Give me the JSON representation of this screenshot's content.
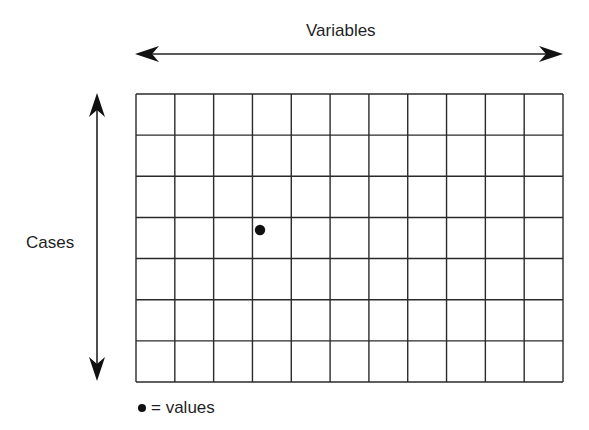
{
  "diagram": {
    "top_label": "Variables",
    "side_label": "Cases",
    "legend": {
      "symbol": "dot",
      "text": "= values"
    },
    "grid": {
      "rows": 7,
      "columns": 11
    },
    "highlighted_cell": {
      "row": 4,
      "column": 4,
      "marker": "dot"
    },
    "colors": {
      "line": "#2a2a2a",
      "background": "#ffffff",
      "dot": "#111111"
    }
  }
}
